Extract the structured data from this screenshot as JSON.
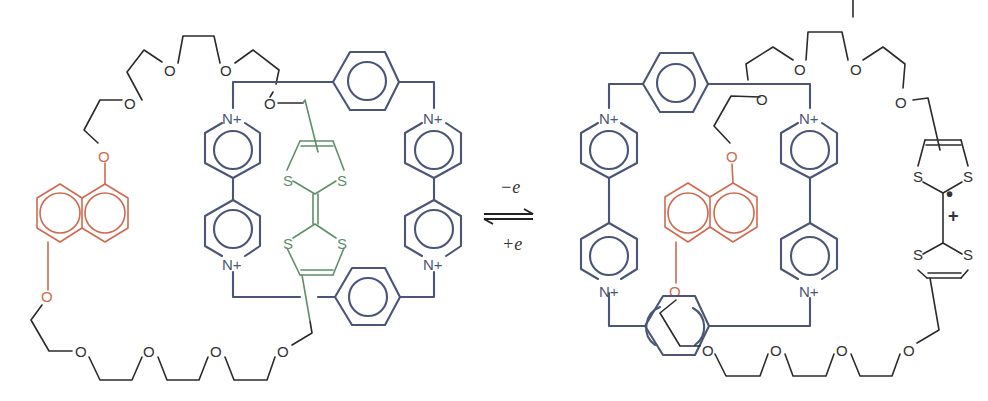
{
  "figure": {
    "type": "redox-switchable rotaxane/catenane scheme",
    "colors": {
      "polyether_chain": "#2b2b2b",
      "cyclobis_paraquat_box": "#4a5578",
      "dioxynaphthalene": "#cf6a4f",
      "tetrathiafulvalene": "#5f8f6a"
    },
    "left_state": {
      "oxygen_label": "O",
      "nitrogen_label": "N+",
      "sulfur_label": "S",
      "description": "TTF unit (green) inside tetracationic cyclophane; DNP (orange) outside"
    },
    "equilibrium": {
      "forward_label": "−e",
      "reverse_label": "+e"
    },
    "right_state": {
      "oxygen_label": "O",
      "nitrogen_label": "N+",
      "sulfur_label": "S",
      "radical_dot": "•",
      "charge_label": "+",
      "description": "Oxidized TTF radical cation outside; DNP (orange) inside cyclophane"
    }
  }
}
